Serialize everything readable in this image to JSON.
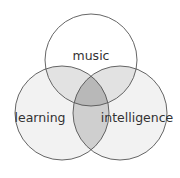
{
  "diagram": {
    "type": "venn",
    "sets": [
      {
        "id": "music",
        "label": "music"
      },
      {
        "id": "learning",
        "label": "learning"
      },
      {
        "id": "intelligence",
        "label": "intelligence"
      }
    ],
    "colors": {
      "background": "#ffffff",
      "stroke": "#555555",
      "pair_overlap": "#e2e2e2",
      "triple_overlap": "#b8b8b8",
      "single": "#f2f2f2"
    }
  }
}
